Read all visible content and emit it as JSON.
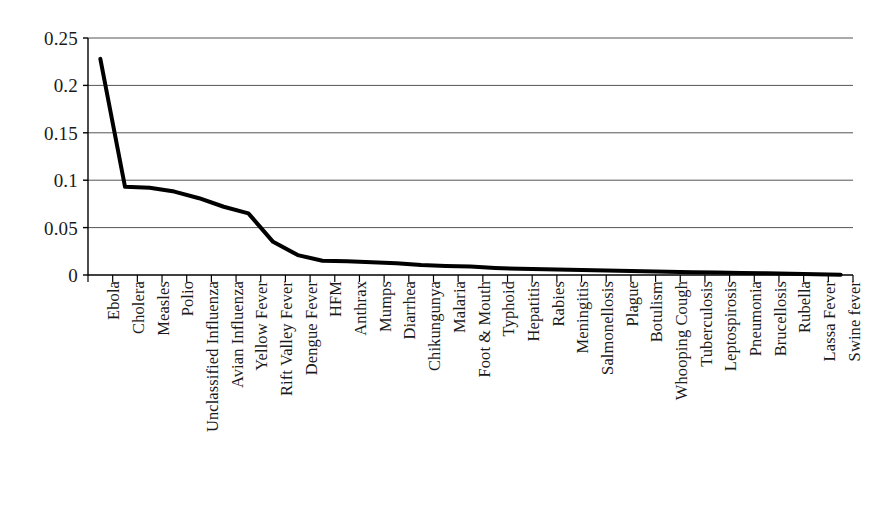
{
  "chart_data": {
    "type": "line",
    "title": "",
    "subtitle": "",
    "xlabel": "",
    "ylabel": "",
    "ylim": [
      0,
      0.25
    ],
    "ytick_labels": [
      "0.25",
      "0.2",
      "0.15",
      "0.1",
      "0.05",
      "0"
    ],
    "ytick_values": [
      0.25,
      0.2,
      0.15,
      0.1,
      0.05,
      0
    ],
    "grid": "horizontal",
    "legend": "none",
    "line_color": "#000000",
    "line_width": 4,
    "axis_color": "#000000",
    "grid_color": "#555555",
    "categories": [
      "Ebola",
      "Cholera",
      "Measles",
      "Polio",
      "Unclassified Influenza",
      "Avian Influenza",
      "Yellow Fever",
      "Rift Valley Fever",
      "Dengue Fever",
      "HFM",
      "Anthrax",
      "Mumps",
      "Diarrhea",
      "Chikungunya",
      "Malaria",
      "Foot & Mouth",
      "Typhoid",
      "Hepatitis",
      "Rabies",
      "Meningitis",
      "Salmonellosis",
      "Plague",
      "Botulism",
      "Whooping Cough",
      "Tuberculosis",
      "Leptospirosis",
      "Pneumonia",
      "Brucellosis",
      "Rubella",
      "Lassa Fever",
      "Swine fever"
    ],
    "values": [
      0.228,
      0.093,
      0.092,
      0.088,
      0.081,
      0.072,
      0.065,
      0.035,
      0.021,
      0.015,
      0.0145,
      0.0135,
      0.0125,
      0.0105,
      0.0095,
      0.009,
      0.0075,
      0.0065,
      0.006,
      0.0055,
      0.005,
      0.0045,
      0.004,
      0.0035,
      0.003,
      0.0026,
      0.0022,
      0.0018,
      0.0014,
      0.0008,
      0.0003
    ]
  }
}
